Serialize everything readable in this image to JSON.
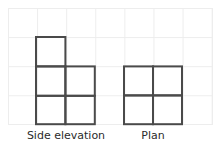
{
  "figure": {
    "title": "",
    "background": {
      "grid_color": "#ededed",
      "grid_cell_px": 29,
      "grid_origin_x": 8,
      "grid_origin_y": 8,
      "grid_cols": 7,
      "grid_rows": 4
    },
    "stroke_color": "#4a4a4a",
    "stroke_width": 2,
    "text_color": "#2b2b2b",
    "shapes": [
      {
        "name": "side-elevation",
        "label": "Side elevation",
        "description": "L-shaped orthographic view made of three unit squares: one square in the upper-left, and a 2-wide by 1-tall row beneath spanning two columns, total 5 squares arrangement",
        "unit_cells": [
          {
            "col": 0,
            "row": 0
          },
          {
            "col": 0,
            "row": 1
          },
          {
            "col": 1,
            "row": 1
          },
          {
            "col": 0,
            "row": 2
          },
          {
            "col": 1,
            "row": 2
          }
        ],
        "cols": 2,
        "rows": 3,
        "cell_count": 5,
        "origin_x": 36,
        "origin_y": 37,
        "cell_px": 29.4
      },
      {
        "name": "plan",
        "label": "Plan",
        "description": "Two by two square grid of four unit squares",
        "unit_cells": [
          {
            "col": 0,
            "row": 0
          },
          {
            "col": 1,
            "row": 0
          },
          {
            "col": 0,
            "row": 1
          },
          {
            "col": 1,
            "row": 1
          }
        ],
        "cols": 2,
        "rows": 2,
        "cell_count": 4,
        "origin_x": 124,
        "origin_y": 66,
        "cell_px": 29.0
      }
    ]
  },
  "captions": {
    "side_elevation": "Side elevation",
    "plan": "Plan"
  }
}
